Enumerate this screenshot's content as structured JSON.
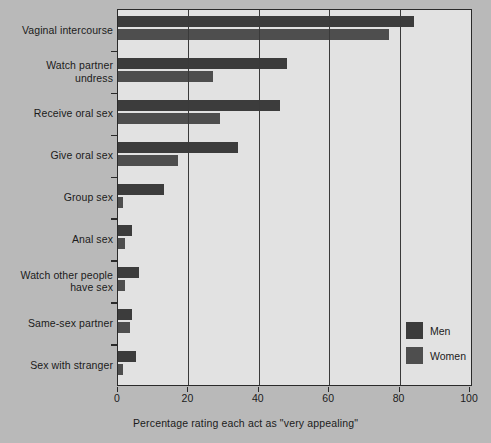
{
  "chart_data": {
    "type": "bar",
    "orientation": "horizontal",
    "title": "",
    "xlabel": "Percentage rating each act as \"very appealing\"",
    "ylabel": "",
    "xlim": [
      0,
      100
    ],
    "xticks": [
      0,
      20,
      40,
      60,
      80,
      100
    ],
    "xtick_labels": [
      "0",
      "20",
      "40",
      "60",
      "80",
      "100"
    ],
    "grid": true,
    "legend_position": "bottom-right",
    "categories": [
      "Vaginal intercourse",
      "Watch partner undress",
      "Receive oral sex",
      "Give oral sex",
      "Group sex",
      "Anal sex",
      "Watch other people have sex",
      "Same-sex partner",
      "Sex with stranger"
    ],
    "category_lines": [
      [
        "Vaginal intercourse"
      ],
      [
        "Watch partner",
        "undress"
      ],
      [
        "Receive oral sex"
      ],
      [
        "Give oral sex"
      ],
      [
        "Group sex"
      ],
      [
        "Anal sex"
      ],
      [
        "Watch other people",
        "have sex"
      ],
      [
        "Same-sex partner"
      ],
      [
        "Sex with stranger"
      ]
    ],
    "series": [
      {
        "name": "Men",
        "color": "#3c3c3c",
        "values": [
          84,
          48,
          46,
          34,
          13,
          4,
          6,
          4,
          5
        ]
      },
      {
        "name": "Women",
        "color": "#4e4e4e",
        "values": [
          77,
          27,
          29,
          17,
          1.5,
          2,
          2,
          3.5,
          1.5
        ]
      }
    ]
  },
  "legend": {
    "items": [
      {
        "label": "Men",
        "color": "#3c3c3c"
      },
      {
        "label": "Women",
        "color": "#4e4e4e"
      }
    ]
  },
  "colors": {
    "background": "#b9b9b9",
    "plot_background": "#e2e2e2",
    "axis": "#2a2a2a",
    "men": "#3c3c3c",
    "women": "#4e4e4e"
  }
}
